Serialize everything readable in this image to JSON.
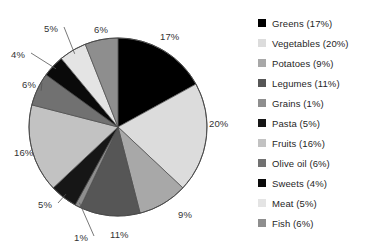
{
  "chart_data": {
    "type": "pie",
    "title": "",
    "subtitle": "",
    "xlabel": "",
    "ylabel": "",
    "grid": false,
    "legend_position": "right",
    "start_angle_deg": 0,
    "direction": "clockwise",
    "units": "percent",
    "categories": [
      "Greens",
      "Vegetables",
      "Potatoes",
      "Legumes",
      "Grains",
      "Pasta",
      "Fruits",
      "Olive oil",
      "Sweets",
      "Meat",
      "Fish"
    ],
    "values": [
      17,
      20,
      9,
      11,
      1,
      5,
      16,
      6,
      4,
      5,
      6
    ],
    "slices": [
      {
        "name": "Greens",
        "value": 17,
        "label": "17%",
        "legend_label": "Greens (17%)",
        "color": "#000000"
      },
      {
        "name": "Vegetables",
        "value": 20,
        "label": "20%",
        "legend_label": "Vegetables (20%)",
        "color": "#dcdcdc"
      },
      {
        "name": "Potatoes",
        "value": 9,
        "label": "9%",
        "legend_label": "Potatoes (9%)",
        "color": "#a8a8a8"
      },
      {
        "name": "Legumes",
        "value": 11,
        "label": "11%",
        "legend_label": "Legumes (11%)",
        "color": "#565656"
      },
      {
        "name": "Grains",
        "value": 1,
        "label": "1%",
        "legend_label": "Grains (1%)",
        "color": "#8e8e8e"
      },
      {
        "name": "Pasta",
        "value": 5,
        "label": "5%",
        "legend_label": "Pasta (5%)",
        "color": "#161616"
      },
      {
        "name": "Fruits",
        "value": 16,
        "label": "16%",
        "legend_label": "Fruits (16%)",
        "color": "#c2c2c2"
      },
      {
        "name": "Olive oil",
        "value": 6,
        "label": "6%",
        "legend_label": "Olive oil (6%)",
        "color": "#717171"
      },
      {
        "name": "Sweets",
        "value": 4,
        "label": "4%",
        "legend_label": "Sweets (4%)",
        "color": "#0a0a0a"
      },
      {
        "name": "Meat",
        "value": 5,
        "label": "5%",
        "legend_label": "Meat (5%)",
        "color": "#e4e4e4"
      },
      {
        "name": "Fish",
        "value": 6,
        "label": "6%",
        "legend_label": "Fish (6%)",
        "color": "#8e8e8e"
      }
    ]
  },
  "pie_geometry": {
    "center_x": 118,
    "center_y": 127,
    "radius": 89,
    "outline_color": "#4a4a4a"
  },
  "labels": [
    {
      "key": "greens",
      "text": "17%",
      "x": 160,
      "y": 31,
      "leader": false
    },
    {
      "key": "vegetables",
      "text": "20%",
      "x": 209,
      "y": 118,
      "leader": false
    },
    {
      "key": "potatoes",
      "text": "9%",
      "x": 178,
      "y": 209,
      "leader": false
    },
    {
      "key": "legumes",
      "text": "11%",
      "x": 110,
      "y": 229,
      "leader": false
    },
    {
      "key": "grains",
      "text": "1%",
      "x": 74,
      "y": 232,
      "leader": true
    },
    {
      "key": "pasta",
      "text": "5%",
      "x": 38,
      "y": 199,
      "leader": true
    },
    {
      "key": "fruits",
      "text": "16%",
      "x": 14,
      "y": 147,
      "leader": false
    },
    {
      "key": "oliveoil",
      "text": "6%",
      "x": 22,
      "y": 79,
      "leader": true
    },
    {
      "key": "sweets",
      "text": "4%",
      "x": 11,
      "y": 49,
      "leader": true
    },
    {
      "key": "meat",
      "text": "5%",
      "x": 44,
      "y": 23,
      "leader": true
    },
    {
      "key": "fish",
      "text": "6%",
      "x": 94,
      "y": 24,
      "leader": false
    }
  ],
  "legend": {
    "items": [
      {
        "label": "Greens (17%)",
        "color": "#000000"
      },
      {
        "label": "Vegetables (20%)",
        "color": "#dcdcdc"
      },
      {
        "label": "Potatoes (9%)",
        "color": "#a8a8a8"
      },
      {
        "label": "Legumes (11%)",
        "color": "#565656"
      },
      {
        "label": "Grains (1%)",
        "color": "#8e8e8e"
      },
      {
        "label": "Pasta (5%)",
        "color": "#161616"
      },
      {
        "label": "Fruits (16%)",
        "color": "#c2c2c2"
      },
      {
        "label": "Olive oil (6%)",
        "color": "#717171"
      },
      {
        "label": "Sweets (4%)",
        "color": "#0a0a0a"
      },
      {
        "label": "Meat (5%)",
        "color": "#e4e4e4"
      },
      {
        "label": "Fish (6%)",
        "color": "#8e8e8e"
      }
    ]
  }
}
